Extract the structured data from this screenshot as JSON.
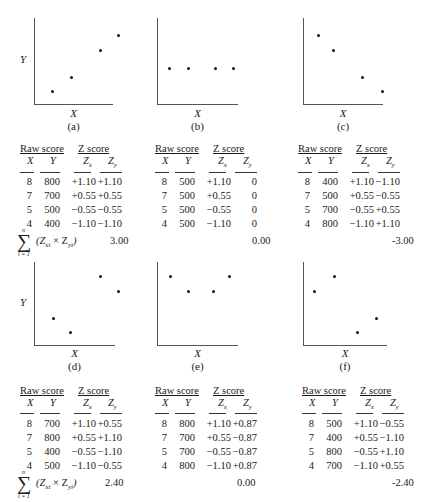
{
  "labels": {
    "y_axis": "Y",
    "x_axis": "X",
    "raw_score_header": "Raw score",
    "z_score_header": "Z score",
    "col_x": "X",
    "col_y": "Y",
    "col_zx": "Z",
    "col_zx_sub": "x",
    "col_zy": "Z",
    "col_zy_sub": "y",
    "sum_expr": "(Z",
    "sum_xi": "xi",
    "sum_times": " × Z",
    "sum_yi": "yi",
    "sum_close": ")",
    "sigma": "∑",
    "sigma_top": "n",
    "sigma_bot": "i = 1"
  },
  "panels": [
    {
      "caption": "(a)",
      "sum": "3.00",
      "rows": [
        [
          "8",
          "800",
          "+1.10",
          "+1.10"
        ],
        [
          "7",
          "700",
          "+0.55",
          "+0.55"
        ],
        [
          "5",
          "500",
          "−0.55",
          "−0.55"
        ],
        [
          "4",
          "400",
          "−1.10",
          "−1.10"
        ]
      ]
    },
    {
      "caption": "(b)",
      "sum": "0.00",
      "rows": [
        [
          "8",
          "500",
          "+1.10",
          "0"
        ],
        [
          "7",
          "500",
          "+0.55",
          "0"
        ],
        [
          "5",
          "500",
          "−0.55",
          "0"
        ],
        [
          "4",
          "500",
          "−1.10",
          "0"
        ]
      ]
    },
    {
      "caption": "(c)",
      "sum": "-3.00",
      "rows": [
        [
          "8",
          "400",
          "+1.10",
          "−1.10"
        ],
        [
          "7",
          "500",
          "+0.55",
          "−0.55"
        ],
        [
          "5",
          "700",
          "−0.55",
          "+0.55"
        ],
        [
          "4",
          "800",
          "−1.10",
          "+1.10"
        ]
      ]
    },
    {
      "caption": "(d)",
      "sum": "2.40",
      "rows": [
        [
          "8",
          "700",
          "+1.10",
          "+0.55"
        ],
        [
          "7",
          "800",
          "+0.55",
          "+1.10"
        ],
        [
          "5",
          "400",
          "−0.55",
          "−1.10"
        ],
        [
          "4",
          "500",
          "−1.10",
          "−0.55"
        ]
      ]
    },
    {
      "caption": "(e)",
      "sum": "0.00",
      "rows": [
        [
          "8",
          "800",
          "+1.10",
          "+0.87"
        ],
        [
          "7",
          "700",
          "+0.55",
          "−0.87"
        ],
        [
          "5",
          "700",
          "−0.55",
          "−0.87"
        ],
        [
          "4",
          "800",
          "−1.10",
          "+0.87"
        ]
      ]
    },
    {
      "caption": "(f)",
      "sum": "-2.40",
      "rows": [
        [
          "8",
          "500",
          "+1.10",
          "−0.55"
        ],
        [
          "7",
          "400",
          "+0.55",
          "−1.10"
        ],
        [
          "5",
          "800",
          "−0.55",
          "+1.10"
        ],
        [
          "4",
          "700",
          "−1.10",
          "+0.55"
        ]
      ]
    }
  ]
}
